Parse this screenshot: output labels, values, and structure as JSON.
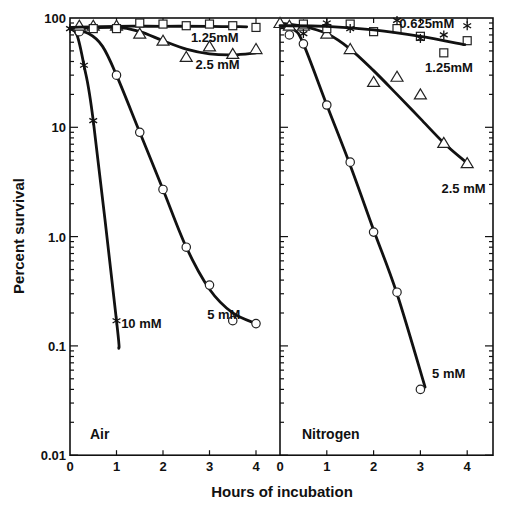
{
  "chart_data": {
    "type": "line",
    "title": "",
    "xlabel": "Hours of incubation",
    "ylabel": "Percent survival",
    "yscale": "log",
    "ylim": [
      0.01,
      100
    ],
    "xlim": [
      0,
      4.5
    ],
    "y_ticks": [
      "100",
      "10",
      "1.0",
      "0.1",
      "0.01"
    ],
    "x_ticks": [
      "0",
      "1",
      "2",
      "3",
      "4"
    ],
    "grid": false,
    "panels": [
      {
        "label": "Air",
        "series": [
          {
            "name": "10 mM",
            "marker": "star",
            "points": [
              [
                0,
                80
              ],
              [
                0.3,
                37
              ],
              [
                0.5,
                11.5
              ],
              [
                1.0,
                0.17
              ]
            ],
            "curve": [
              [
                0,
                80
              ],
              [
                0.15,
                70
              ],
              [
                0.3,
                37
              ],
              [
                0.5,
                11.5
              ],
              [
                1.0,
                0.17
              ],
              [
                1.05,
                0.095
              ]
            ],
            "label_pos": [
              1.1,
              0.16
            ]
          },
          {
            "name": "5 mM",
            "marker": "circle",
            "points": [
              [
                0.2,
                75
              ],
              [
                1.0,
                30
              ],
              [
                1.5,
                9
              ],
              [
                2.0,
                2.7
              ],
              [
                2.5,
                0.8
              ],
              [
                3.0,
                0.36
              ],
              [
                3.5,
                0.17
              ],
              [
                4.0,
                0.16
              ]
            ],
            "curve": [
              [
                0,
                80
              ],
              [
                0.4,
                72
              ],
              [
                0.7,
                55
              ],
              [
                1.0,
                30
              ],
              [
                1.5,
                9
              ],
              [
                2.0,
                2.7
              ],
              [
                2.5,
                0.8
              ],
              [
                3.0,
                0.33
              ],
              [
                3.5,
                0.2
              ],
              [
                4.0,
                0.16
              ]
            ],
            "label_pos": [
              2.95,
              0.19
            ]
          },
          {
            "name": "2.5 mM",
            "marker": "triangle",
            "points": [
              [
                0.2,
                85
              ],
              [
                0.5,
                85
              ],
              [
                1.0,
                85
              ],
              [
                1.5,
                72
              ],
              [
                2.0,
                62
              ],
              [
                2.5,
                44
              ],
              [
                3.0,
                55
              ],
              [
                3.5,
                47
              ],
              [
                4.0,
                52
              ]
            ],
            "curve": [
              [
                0,
                80
              ],
              [
                1.0,
                82
              ],
              [
                1.5,
                75
              ],
              [
                2.0,
                62
              ],
              [
                2.5,
                52
              ],
              [
                3.0,
                47
              ],
              [
                3.5,
                46
              ],
              [
                4.0,
                48
              ]
            ],
            "label_pos": [
              2.7,
              37
            ]
          },
          {
            "name": "1.25mM",
            "marker": "square",
            "points": [
              [
                0.5,
                80
              ],
              [
                1.0,
                80
              ],
              [
                1.5,
                90
              ],
              [
                2.0,
                88
              ],
              [
                2.5,
                85
              ],
              [
                3.0,
                88
              ],
              [
                3.5,
                85
              ],
              [
                4.0,
                82
              ]
            ],
            "curve": [
              [
                0,
                82
              ],
              [
                1.0,
                84
              ],
              [
                2.0,
                84
              ],
              [
                3.0,
                84
              ],
              [
                3.8,
                83
              ]
            ],
            "label_pos": [
              2.6,
              65
            ]
          }
        ]
      },
      {
        "label": "Nitrogen",
        "series": [
          {
            "name": "5 mM",
            "marker": "circle",
            "points": [
              [
                0.2,
                70
              ],
              [
                0.5,
                58
              ],
              [
                1.0,
                16
              ],
              [
                1.5,
                4.8
              ],
              [
                2.0,
                1.1
              ],
              [
                2.5,
                0.31
              ],
              [
                3.0,
                0.04
              ]
            ],
            "curve": [
              [
                0,
                85
              ],
              [
                0.3,
                78
              ],
              [
                0.5,
                58
              ],
              [
                1.0,
                16
              ],
              [
                1.5,
                4.5
              ],
              [
                2.0,
                1.15
              ],
              [
                2.5,
                0.3
              ],
              [
                3.1,
                0.042
              ]
            ],
            "label_pos": [
              3.25,
              0.055
            ]
          },
          {
            "name": "2.5 mM",
            "marker": "triangle",
            "points": [
              [
                0,
                90
              ],
              [
                0.2,
                85
              ],
              [
                0.5,
                85
              ],
              [
                1.0,
                72
              ],
              [
                1.5,
                52
              ],
              [
                2.0,
                26
              ],
              [
                2.5,
                29
              ],
              [
                3.0,
                20
              ],
              [
                3.5,
                7.2
              ],
              [
                4.0,
                4.7
              ]
            ],
            "curve": [
              [
                0,
                90
              ],
              [
                0.5,
                84
              ],
              [
                1.0,
                72
              ],
              [
                1.5,
                52
              ],
              [
                2.0,
                33
              ],
              [
                2.5,
                20
              ],
              [
                3.0,
                12
              ],
              [
                3.5,
                7.2
              ],
              [
                4.0,
                4.7
              ]
            ],
            "label_pos": [
              3.45,
              2.7
            ]
          },
          {
            "name": "1.25mM",
            "marker": "square",
            "points": [
              [
                0.5,
                88
              ],
              [
                1.0,
                80
              ],
              [
                1.5,
                88
              ],
              [
                2.0,
                75
              ],
              [
                2.5,
                80
              ],
              [
                3.0,
                68
              ],
              [
                3.5,
                48
              ],
              [
                4.0,
                62
              ]
            ],
            "curve": [],
            "label_pos": [
              3.1,
              35
            ]
          },
          {
            "name": "0.625mM",
            "marker": "star",
            "points": [
              [
                0.5,
                72
              ],
              [
                1.0,
                90
              ],
              [
                1.5,
                80
              ],
              [
                2.5,
                95
              ],
              [
                3.0,
                65
              ],
              [
                3.5,
                70
              ],
              [
                4.0,
                85
              ]
            ],
            "curve": [
              [
                0,
                85
              ],
              [
                1.0,
                84
              ],
              [
                2.0,
                78
              ],
              [
                3.0,
                68
              ],
              [
                3.95,
                57
              ]
            ],
            "label_pos": [
              2.55,
              88
            ]
          }
        ]
      }
    ]
  }
}
